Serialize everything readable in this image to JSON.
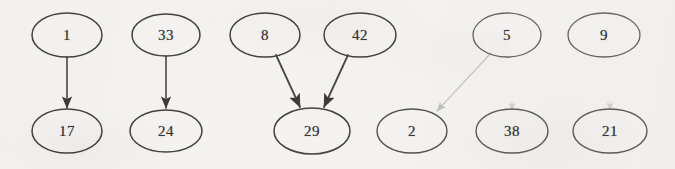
{
  "diagram": {
    "type": "node-link-diagram",
    "canvas": {
      "width": 675,
      "height": 169
    },
    "background_color": "#f4f3f1",
    "ink_color": "#3a3734",
    "faint_ink_color": "#bdb9b4",
    "node_shape": "ellipse",
    "nodes": [
      {
        "id": "n1",
        "label": "1",
        "cx": 67,
        "cy": 35,
        "rx": 35,
        "ry": 22,
        "row": "top",
        "column": 1,
        "stroke": "#45413d",
        "stroke_width": 1.5,
        "opacity": 1
      },
      {
        "id": "n33",
        "label": "33",
        "cx": 166,
        "cy": 35,
        "rx": 34,
        "ry": 21,
        "row": "top",
        "column": 2,
        "stroke": "#45413d",
        "stroke_width": 1.5,
        "opacity": 1
      },
      {
        "id": "n8",
        "label": "8",
        "cx": 265,
        "cy": 35,
        "rx": 35,
        "ry": 22,
        "row": "top",
        "column": 3,
        "stroke": "#45413d",
        "stroke_width": 1.5,
        "opacity": 1
      },
      {
        "id": "n42",
        "label": "42",
        "cx": 360,
        "cy": 35,
        "rx": 36,
        "ry": 22,
        "row": "top",
        "column": 4,
        "stroke": "#45413d",
        "stroke_width": 1.5,
        "opacity": 1
      },
      {
        "id": "n5",
        "label": "5",
        "cx": 507,
        "cy": 35,
        "rx": 34,
        "ry": 22,
        "row": "top",
        "column": 5,
        "stroke": "#5c5854",
        "stroke_width": 1.3,
        "opacity": 0.92
      },
      {
        "id": "n9",
        "label": "9",
        "cx": 604,
        "cy": 35,
        "rx": 36,
        "ry": 22,
        "row": "top",
        "column": 6,
        "stroke": "#5c5854",
        "stroke_width": 1.3,
        "opacity": 0.92
      },
      {
        "id": "n17",
        "label": "17",
        "cx": 67,
        "cy": 131,
        "rx": 35,
        "ry": 22,
        "row": "bottom",
        "column": 1,
        "stroke": "#45413d",
        "stroke_width": 1.5,
        "opacity": 1
      },
      {
        "id": "n24",
        "label": "24",
        "cx": 166,
        "cy": 131,
        "rx": 36,
        "ry": 21,
        "row": "bottom",
        "column": 2,
        "stroke": "#45413d",
        "stroke_width": 1.5,
        "opacity": 1
      },
      {
        "id": "n29",
        "label": "29",
        "cx": 312,
        "cy": 131,
        "rx": 38,
        "ry": 23,
        "row": "bottom",
        "column": 3,
        "stroke": "#45413d",
        "stroke_width": 1.5,
        "opacity": 1
      },
      {
        "id": "n2",
        "label": "2",
        "cx": 412,
        "cy": 131,
        "rx": 35,
        "ry": 22,
        "row": "bottom",
        "column": 4,
        "stroke": "#4f4b47",
        "stroke_width": 1.4,
        "opacity": 0.96
      },
      {
        "id": "n38",
        "label": "38",
        "cx": 512,
        "cy": 131,
        "rx": 36,
        "ry": 22,
        "row": "bottom",
        "column": 5,
        "stroke": "#57534f",
        "stroke_width": 1.4,
        "opacity": 0.94
      },
      {
        "id": "n21",
        "label": "21",
        "cx": 610,
        "cy": 131,
        "rx": 37,
        "ry": 22,
        "row": "bottom",
        "column": 6,
        "stroke": "#57534f",
        "stroke_width": 1.4,
        "opacity": 0.94
      }
    ],
    "edges": [
      {
        "id": "e1",
        "from": "1",
        "to": "17",
        "x1": 67,
        "y1": 57,
        "x2": 67,
        "y2": 108,
        "kind": "arrow",
        "style": "solid",
        "stroke": "#4a4642",
        "stroke_width": 1.6,
        "opacity": 1
      },
      {
        "id": "e2",
        "from": "33",
        "to": "24",
        "x1": 166,
        "y1": 56,
        "x2": 166,
        "y2": 108,
        "kind": "arrow",
        "style": "solid",
        "stroke": "#4a4642",
        "stroke_width": 1.6,
        "opacity": 1
      },
      {
        "id": "e3",
        "from": "8",
        "to": "29",
        "x1": 276,
        "y1": 55,
        "x2": 300,
        "y2": 107,
        "kind": "arrow",
        "style": "solid",
        "stroke": "#4a4642",
        "stroke_width": 1.8,
        "opacity": 1
      },
      {
        "id": "e4",
        "from": "42",
        "to": "29",
        "x1": 348,
        "y1": 55,
        "x2": 324,
        "y2": 107,
        "kind": "arrow",
        "style": "solid",
        "stroke": "#4a4642",
        "stroke_width": 1.8,
        "opacity": 1
      },
      {
        "id": "e5",
        "from": "5",
        "to": "2",
        "x1": 491,
        "y1": 53,
        "x2": 437,
        "y2": 111,
        "kind": "arrow",
        "style": "faint",
        "stroke": "#c3bfba",
        "stroke_width": 1.2,
        "opacity": 0.85
      },
      {
        "id": "e6",
        "from": "9",
        "to": "38",
        "x1": 512,
        "y1": 101,
        "x2": 512,
        "y2": 110,
        "kind": "arrow-stub",
        "style": "faint",
        "stroke": "#cfcbc6",
        "stroke_width": 1.1,
        "opacity": 0.7
      },
      {
        "id": "e7",
        "from": "9",
        "to": "21",
        "x1": 610,
        "y1": 101,
        "x2": 610,
        "y2": 110,
        "kind": "arrow-stub",
        "style": "faint",
        "stroke": "#cfcbc6",
        "stroke_width": 1.1,
        "opacity": 0.7
      }
    ]
  }
}
